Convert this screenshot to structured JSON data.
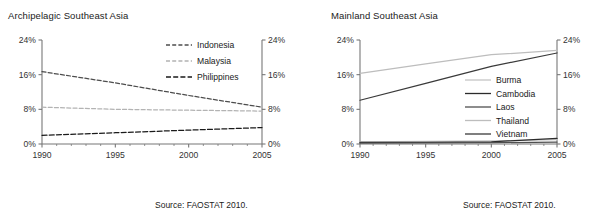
{
  "chart_data": [
    {
      "type": "line",
      "title": "Archipelagic Southeast Asia",
      "xlabel": "",
      "ylabel": "",
      "x": [
        1990,
        1995,
        2000,
        2005
      ],
      "xlim": [
        1990,
        2005
      ],
      "ylim": [
        0,
        24
      ],
      "xticks": [
        "1990",
        "1995",
        "2000",
        "2005"
      ],
      "yticks": [
        "0%",
        "8%",
        "16%",
        "24%"
      ],
      "ytick_values": [
        0,
        8,
        16,
        24
      ],
      "grid": false,
      "legend_position": "top-right-inside",
      "source": "Source: FAOSTAT 2010.",
      "series": [
        {
          "name": "Indonesia",
          "values": [
            16.7,
            14.1,
            11.2,
            8.5
          ],
          "color": "#4d4d4d",
          "dash": "4,2.2"
        },
        {
          "name": "Malaysia",
          "values": [
            8.5,
            8.0,
            7.8,
            7.6
          ],
          "color": "#b3b3b3",
          "dash": "4,2.2"
        },
        {
          "name": "Philippines",
          "values": [
            2.0,
            2.6,
            3.2,
            3.8
          ],
          "color": "#1a1a1a",
          "dash": "5,2.2"
        }
      ]
    },
    {
      "type": "line",
      "title": "Mainland Southeast Asia",
      "xlabel": "",
      "ylabel": "",
      "x": [
        1990,
        1995,
        2000,
        2005
      ],
      "xlim": [
        1990,
        2005
      ],
      "ylim": [
        0,
        24
      ],
      "xticks": [
        "1990",
        "1995",
        "2000",
        "2005"
      ],
      "yticks": [
        "0%",
        "8%",
        "16%",
        "24%"
      ],
      "ytick_values": [
        0,
        8,
        16,
        24
      ],
      "grid": false,
      "legend_position": "middle-right-inside",
      "source": "Source: FAOSTAT 2010.",
      "series": [
        {
          "name": "Burma",
          "values": [
            0.5,
            0.6,
            0.7,
            1.0
          ],
          "color": "#c4c4c4",
          "dash": "none"
        },
        {
          "name": "Cambodia",
          "values": [
            0.35,
            0.4,
            0.5,
            1.3
          ],
          "color": "#2b2b2b",
          "dash": "none"
        },
        {
          "name": "Laos",
          "values": [
            0.2,
            0.25,
            0.3,
            0.45
          ],
          "color": "#4f4f4f",
          "dash": "none"
        },
        {
          "name": "Thailand",
          "values": [
            16.3,
            18.5,
            20.6,
            21.6
          ],
          "color": "#bdbdbd",
          "dash": "none"
        },
        {
          "name": "Vietnam",
          "values": [
            10.1,
            14.0,
            17.9,
            21.0
          ],
          "color": "#3a3a3a",
          "dash": "none"
        }
      ]
    }
  ]
}
